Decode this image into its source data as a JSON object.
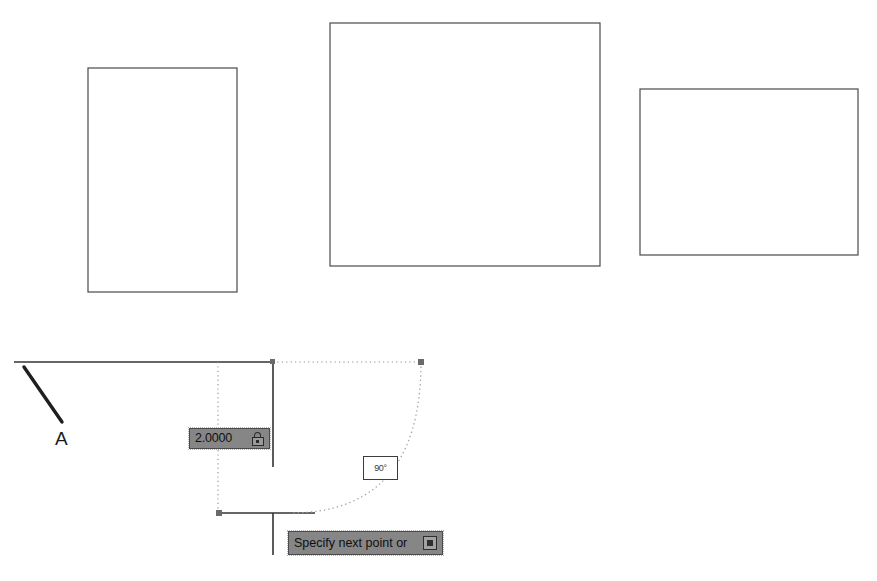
{
  "canvas": {
    "background_color": "#ffffff",
    "width": 877,
    "height": 581
  },
  "shapes": {
    "rectangles": [
      {
        "name": "rectangle-left",
        "x": 88,
        "y": 68,
        "width": 149,
        "height": 224,
        "stroke": "#4a4a4a"
      },
      {
        "name": "rectangle-center",
        "x": 330,
        "y": 23,
        "width": 270,
        "height": 243,
        "stroke": "#4a4a4a"
      },
      {
        "name": "rectangle-right",
        "x": 640,
        "y": 89,
        "width": 218,
        "height": 166,
        "stroke": "#4a4a4a"
      }
    ],
    "solid_lines": [
      {
        "name": "top-horizontal-line",
        "x1": 14,
        "y1": 362,
        "x2": 273,
        "y2": 362
      },
      {
        "name": "angled-line-a",
        "x1": 24,
        "y1": 367,
        "x2": 62,
        "y2": 422
      },
      {
        "name": "upper-vertical-line",
        "x1": 273,
        "y1": 362,
        "x2": 273,
        "y2": 467
      },
      {
        "name": "bottom-horizontal-line",
        "x1": 221,
        "y1": 513,
        "x2": 315,
        "y2": 513
      },
      {
        "name": "lower-vertical-line",
        "x1": 273,
        "y1": 513,
        "x2": 273,
        "y2": 555
      }
    ],
    "tracking_lines": [
      {
        "name": "vertical-tracking-line",
        "x1": 218,
        "y1": 362,
        "x2": 218,
        "y2": 513
      },
      {
        "name": "horizontal-tracking-line",
        "x1": 273,
        "y1": 362,
        "x2": 421,
        "y2": 362
      }
    ],
    "arc": {
      "name": "rubber-band-arc",
      "start_x": 421,
      "start_y": 362,
      "end_x": 290,
      "end_y": 513,
      "control_x": 421,
      "control_y": 513
    },
    "node_markers": [
      {
        "name": "node-marker-arc-start",
        "x": 421,
        "y": 362
      },
      {
        "name": "node-marker-corner",
        "x": 273,
        "y": 362
      },
      {
        "name": "node-marker-base-point",
        "x": 219,
        "y": 513
      }
    ]
  },
  "labels": {
    "vertex_a": "A"
  },
  "dimension_input": {
    "value": "2.0000",
    "lock_icon": "lock-icon",
    "background_color": "#868686",
    "border_color": "#4a4a4a"
  },
  "angle_readout": {
    "value": "90°"
  },
  "command_prompt": {
    "text": "Specify next point or",
    "dropdown_icon": "dropdown-box-icon",
    "background_color": "#868686",
    "border_color": "#4a4a4a"
  }
}
